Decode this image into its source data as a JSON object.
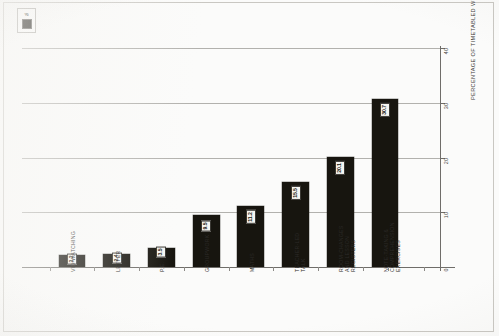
{
  "chart_data": {
    "type": "bar",
    "title": "",
    "subtitle": "",
    "xlabel": "",
    "ylabel": "PERCENTAGE OF TIMETABLED WEEK",
    "ylim": [
      0,
      40
    ],
    "yticks": [
      0,
      10,
      20,
      30,
      40
    ],
    "grid": true,
    "grid_axis": "y",
    "axis_position": {
      "value_axis": "right",
      "category_axis": "bottom"
    },
    "legend": {
      "position": "top-left",
      "entries": [
        {
          "label": "%",
          "color": "#17150f"
        }
      ]
    },
    "orientation": "vertical",
    "bar_color": "#17150f",
    "value_label_color": "#17150f",
    "value_label_background": "#f6f5f1",
    "value_label_rotation": -90,
    "category_label_rotation": -90,
    "categories": [
      "VID-WATCHING",
      "LETTER",
      "P.E.",
      "GROUPWORK",
      "MATHS",
      "TEACHER-LED TALK",
      "ROOM-CHANGES AND LESSON REGISTERS",
      "NOTE-TAKING & COMPREHENSION EXERCISES"
    ],
    "category_label_lines": [
      [
        "VID-WATCHING"
      ],
      [
        "LETTER"
      ],
      [
        "P.E."
      ],
      [
        "GROUPWORK"
      ],
      [
        "MATHS"
      ],
      [
        "TEACHER-LED",
        "TALK"
      ],
      [
        "ROOM-CHANGES",
        "AND LESSON",
        "REGISTERS"
      ],
      [
        "NOTE-TAKING &",
        "COMPREHENSION",
        "EXERCISES"
      ]
    ],
    "values": [
      2.2,
      2.4,
      3.5,
      9.5,
      11.2,
      15.5,
      20.1,
      30.7
    ],
    "value_labels": [
      "2.2",
      "2.4",
      "3.5",
      "9.5",
      "11.2",
      "15.5",
      "20.1",
      "30.7"
    ]
  },
  "axis": {
    "tick_labels": [
      "0",
      "10",
      "20",
      "30",
      "40"
    ],
    "title": "PERCENTAGE OF TIMETABLED WEEK"
  },
  "legend": {
    "label": "%",
    "swatch_name": "black-square-marker"
  }
}
